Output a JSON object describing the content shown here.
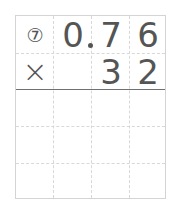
{
  "problem": {
    "number_label": "⑦",
    "multiplicand": [
      "0",
      "7",
      "6"
    ],
    "decimal_after_index": 0,
    "operator": "×",
    "multiplier": [
      "3",
      "2"
    ]
  },
  "grid": {
    "columns": 4,
    "rows": 5,
    "answer_rows": 3
  }
}
